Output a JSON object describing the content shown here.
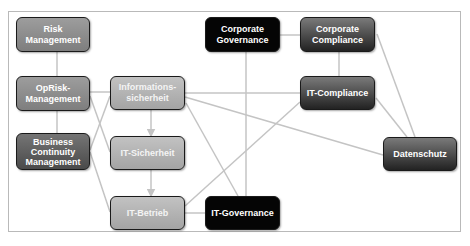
{
  "diagram": {
    "nodes": {
      "risk_management": {
        "label": "Risk\nManagement"
      },
      "oprisk_management": {
        "label": "OpRisk-\nManagement"
      },
      "informationssicherheit": {
        "label": "Informations-\nsicherheit"
      },
      "business_continuity": {
        "label": "Business\nContinuity\nManagement"
      },
      "it_sicherheit": {
        "label": "IT-Sicherheit"
      },
      "it_betrieb": {
        "label": "IT-Betrieb"
      },
      "it_governance": {
        "label": "IT-Governance"
      },
      "corporate_governance": {
        "label": "Corporate\nGovernance"
      },
      "corporate_compliance": {
        "label": "Corporate\nCompliance"
      },
      "it_compliance": {
        "label": "IT-Compliance"
      },
      "datenschutz": {
        "label": "Datenschutz"
      }
    },
    "edges": [
      [
        "risk_management",
        "oprisk_management"
      ],
      [
        "oprisk_management",
        "business_continuity"
      ],
      [
        "oprisk_management",
        "informationssicherheit"
      ],
      [
        "oprisk_management",
        "it_sicherheit"
      ],
      [
        "business_continuity",
        "informationssicherheit"
      ],
      [
        "business_continuity",
        "it_betrieb"
      ],
      [
        "informationssicherheit",
        "it_sicherheit"
      ],
      [
        "it_sicherheit",
        "it_betrieb"
      ],
      [
        "informationssicherheit",
        "it_compliance"
      ],
      [
        "informationssicherheit",
        "datenschutz"
      ],
      [
        "informationssicherheit",
        "it_governance"
      ],
      [
        "it_betrieb",
        "it_governance"
      ],
      [
        "it_betrieb",
        "it_compliance"
      ],
      [
        "corporate_governance",
        "corporate_compliance"
      ],
      [
        "corporate_governance",
        "it_governance"
      ],
      [
        "corporate_compliance",
        "it_compliance"
      ],
      [
        "corporate_compliance",
        "datenschutz"
      ],
      [
        "it_compliance",
        "datenschutz"
      ]
    ],
    "colors": {
      "line": "#c4c4c4",
      "frame": "#b9b9b9",
      "black_node": "#050505",
      "text": "#ffffff"
    }
  }
}
